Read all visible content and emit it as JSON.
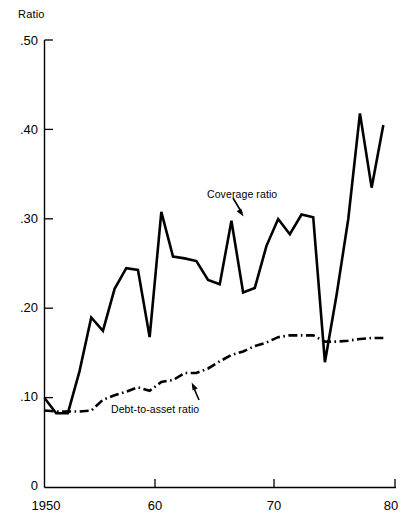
{
  "chart_data": {
    "type": "line",
    "title": "",
    "xlabel": "",
    "ylabel": "Ratio",
    "xlim": [
      1950,
      1980
    ],
    "ylim": [
      0,
      0.5
    ],
    "grid": false,
    "legend_position": "inline-annotations",
    "x_tick_labels": [
      "1950",
      "60",
      "70",
      "80"
    ],
    "x_tick_values": [
      1950,
      1960,
      1970,
      1980
    ],
    "y_tick_labels": [
      "0",
      ".10",
      ".20",
      ".30",
      ".40",
      ".50"
    ],
    "y_tick_values": [
      0,
      0.1,
      0.2,
      0.3,
      0.4,
      0.5
    ],
    "x": [
      1950,
      1951,
      1952,
      1953,
      1954,
      1955,
      1956,
      1957,
      1958,
      1959,
      1960,
      1961,
      1962,
      1963,
      1964,
      1965,
      1966,
      1967,
      1968,
      1969,
      1970,
      1971,
      1972,
      1973,
      1974,
      1975,
      1976,
      1977,
      1978,
      1979
    ],
    "series": [
      {
        "name": "Coverage ratio",
        "style": "solid",
        "color": "#000000",
        "values": [
          0.1,
          0.083,
          0.083,
          0.13,
          0.19,
          0.175,
          0.222,
          0.245,
          0.243,
          0.168,
          0.308,
          0.258,
          0.256,
          0.253,
          0.232,
          0.227,
          0.298,
          0.218,
          0.223,
          0.27,
          0.3,
          0.283,
          0.305,
          0.302,
          0.14,
          0.215,
          0.3,
          0.418,
          0.335,
          0.405
        ]
      },
      {
        "name": "Debt-to-asset ratio",
        "style": "dash-dot",
        "color": "#000000",
        "values": [
          0.086,
          0.085,
          0.085,
          0.085,
          0.086,
          0.098,
          0.103,
          0.107,
          0.112,
          0.108,
          0.118,
          0.12,
          0.128,
          0.128,
          0.133,
          0.141,
          0.148,
          0.152,
          0.158,
          0.162,
          0.168,
          0.17,
          0.17,
          0.17,
          0.163,
          0.163,
          0.164,
          0.166,
          0.167,
          0.167
        ]
      }
    ],
    "annotations": [
      {
        "text": "Coverage ratio",
        "target_x": 1966,
        "target_y": 0.298
      },
      {
        "text": "Debt-to-asset ratio",
        "target_x": 1963,
        "target_y": 0.128
      }
    ]
  },
  "axis": {
    "y_unit_label": "Ratio"
  }
}
